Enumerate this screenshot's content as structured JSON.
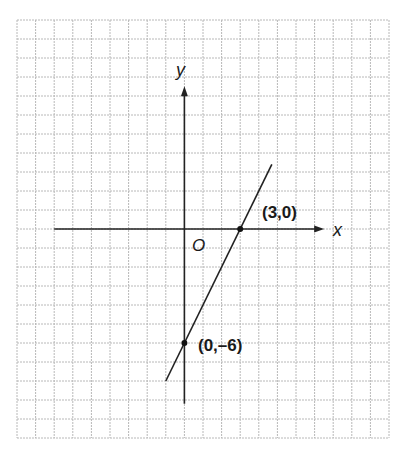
{
  "chart_data": {
    "type": "line",
    "title": "",
    "xlabel": "x",
    "ylabel": "y",
    "origin_label": "O",
    "equation": "y = 2x - 6",
    "grid": true,
    "grid_columns": 20,
    "grid_rows": 22,
    "xlim": [
      -9,
      11
    ],
    "ylim": [
      -11,
      11
    ],
    "axis_extent": {
      "x": [
        -7,
        7.3
      ],
      "y": [
        -9.2,
        7.3
      ]
    },
    "series": [
      {
        "name": "line",
        "x": [
          -1,
          4.7
        ],
        "y": [
          -8,
          3.4
        ]
      }
    ],
    "points": [
      {
        "x": 3,
        "y": 0,
        "label": "(3,0)"
      },
      {
        "x": 0,
        "y": -6,
        "label": "(0,–6)"
      }
    ],
    "colors": {
      "grid": "#b8b8b8",
      "line": "#222222",
      "background": "#ffffff"
    }
  },
  "labels": {
    "x_axis": "x",
    "y_axis": "y",
    "origin": "O",
    "point_x_intercept": "(3,0)",
    "point_y_intercept": "(0,–6)"
  }
}
